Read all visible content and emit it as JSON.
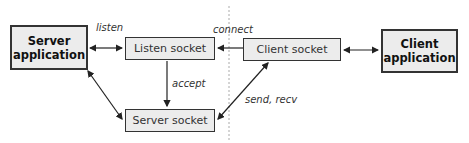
{
  "diagram": {
    "nodes": {
      "server_app": {
        "line1": "Server",
        "line2": "application"
      },
      "listen_socket": {
        "label": "Listen socket"
      },
      "server_socket": {
        "label": "Server socket"
      },
      "client_socket": {
        "label": "Client socket"
      },
      "client_app": {
        "line1": "Client",
        "line2": "application"
      }
    },
    "edge_labels": {
      "listen": "listen",
      "connect": "connect",
      "accept": "accept",
      "send_recv": "send, recv"
    },
    "colors": {
      "box_fill": "#ececec",
      "stroke": "#333333",
      "divider": "#aaaaaa"
    }
  }
}
